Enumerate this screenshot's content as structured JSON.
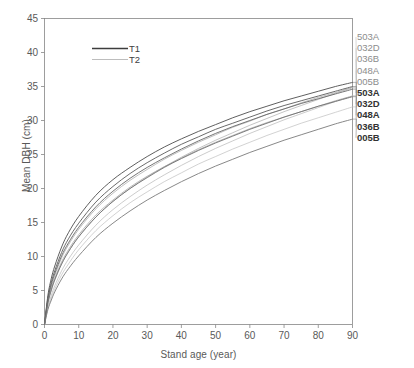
{
  "chart_data": {
    "type": "line",
    "title": "",
    "xlabel": "Stand age (year)",
    "ylabel": "Mean DBH (cm)",
    "xlim": [
      0,
      90
    ],
    "ylim": [
      0,
      45
    ],
    "xticks": [
      0,
      10,
      20,
      30,
      40,
      50,
      60,
      70,
      80,
      90
    ],
    "yticks": [
      0,
      5,
      10,
      15,
      20,
      25,
      30,
      35,
      40,
      45
    ],
    "grid": false,
    "legend": {
      "position": "top-left-inside",
      "entries": [
        {
          "label": "T1",
          "style": "solid",
          "color": "#404040"
        },
        {
          "label": "T2",
          "style": "solid-light",
          "color": "#b0b0b0"
        }
      ]
    },
    "x": [
      0,
      1,
      2,
      3,
      5,
      7,
      10,
      15,
      20,
      25,
      30,
      35,
      40,
      45,
      50,
      55,
      60,
      65,
      70,
      75,
      80,
      85,
      90
    ],
    "series": [
      {
        "name": "503A",
        "group": "T2",
        "color": "#a8a8a8",
        "end_label": "503A",
        "values": [
          0,
          3.1,
          5.0,
          6.5,
          8.9,
          10.7,
          12.9,
          15.8,
          18.1,
          20.0,
          21.7,
          23.2,
          24.6,
          25.9,
          27.1,
          28.2,
          29.3,
          30.3,
          31.3,
          32.2,
          33.1,
          34.0,
          34.8
        ]
      },
      {
        "name": "032D",
        "group": "T2",
        "color": "#a0a0a0",
        "end_label": "032D",
        "values": [
          0,
          3.5,
          5.6,
          7.2,
          9.8,
          11.7,
          14.0,
          17.0,
          19.3,
          21.2,
          22.8,
          24.3,
          25.6,
          26.8,
          27.9,
          29.0,
          29.9,
          30.9,
          31.7,
          32.6,
          33.4,
          34.1,
          34.9
        ]
      },
      {
        "name": "036B",
        "group": "T2",
        "color": "#b4b4b4",
        "end_label": "036B",
        "values": [
          0,
          2.6,
          4.3,
          5.7,
          7.9,
          9.6,
          11.7,
          14.6,
          16.9,
          18.8,
          20.5,
          22.0,
          23.4,
          24.7,
          25.9,
          27.0,
          28.1,
          29.1,
          30.1,
          31.0,
          31.9,
          32.8,
          33.6
        ]
      },
      {
        "name": "048A",
        "group": "T2",
        "color": "#9a9a9a",
        "end_label": "048A",
        "values": [
          0,
          3.3,
          5.3,
          6.8,
          9.2,
          11.0,
          13.2,
          16.1,
          18.3,
          20.2,
          21.8,
          23.2,
          24.5,
          25.7,
          26.8,
          27.8,
          28.8,
          29.7,
          30.5,
          31.3,
          32.1,
          32.9,
          33.6
        ]
      },
      {
        "name": "005B",
        "group": "T2",
        "color": "#bcbcbc",
        "end_label": "005B",
        "values": [
          0,
          2.4,
          3.9,
          5.2,
          7.3,
          8.9,
          11.0,
          13.8,
          16.0,
          17.9,
          19.5,
          21.0,
          22.3,
          23.6,
          24.7,
          25.8,
          26.8,
          27.8,
          28.7,
          29.6,
          30.4,
          31.2,
          32.0
        ]
      },
      {
        "name": "503A",
        "group": "T1",
        "color": "#4d4d4d",
        "end_label": "503A",
        "values": [
          0,
          4.3,
          6.8,
          8.6,
          11.4,
          13.5,
          15.9,
          19.0,
          21.3,
          23.1,
          24.7,
          26.1,
          27.3,
          28.4,
          29.4,
          30.4,
          31.3,
          32.1,
          32.9,
          33.6,
          34.3,
          35.0,
          35.6
        ]
      },
      {
        "name": "032D",
        "group": "T1",
        "color": "#5a5a5a",
        "end_label": "032D",
        "values": [
          0,
          3.9,
          6.2,
          7.9,
          10.6,
          12.6,
          14.9,
          18.0,
          20.3,
          22.2,
          23.8,
          25.2,
          26.5,
          27.6,
          28.7,
          29.6,
          30.5,
          31.4,
          32.2,
          32.9,
          33.6,
          34.3,
          35.0
        ]
      },
      {
        "name": "048A",
        "group": "T1",
        "color": "#666666",
        "end_label": "048A",
        "values": [
          0,
          3.7,
          5.9,
          7.5,
          10.1,
          12.0,
          14.3,
          17.3,
          19.6,
          21.5,
          23.1,
          24.5,
          25.8,
          27.0,
          28.1,
          29.1,
          30.0,
          30.9,
          31.7,
          32.5,
          33.2,
          33.9,
          34.6
        ]
      },
      {
        "name": "036B",
        "group": "T1",
        "color": "#707070",
        "end_label": "036B",
        "values": [
          0,
          3.2,
          5.1,
          6.6,
          8.9,
          10.7,
          12.9,
          15.8,
          18.1,
          20.0,
          21.6,
          23.1,
          24.4,
          25.6,
          26.7,
          27.7,
          28.7,
          29.6,
          30.5,
          31.3,
          32.1,
          32.8,
          33.5
        ]
      },
      {
        "name": "005B",
        "group": "T1",
        "color": "#7a7a7a",
        "end_label": "005B",
        "values": [
          0,
          2.2,
          3.6,
          4.8,
          6.7,
          8.2,
          10.1,
          12.8,
          14.9,
          16.7,
          18.3,
          19.7,
          21.0,
          22.2,
          23.3,
          24.3,
          25.3,
          26.2,
          27.1,
          27.9,
          28.7,
          29.5,
          30.2
        ]
      }
    ]
  },
  "axes": {
    "ylabel": "Mean DBH (cm)",
    "xlabel": "Stand age (year)",
    "yticks": [
      "45",
      "40",
      "35",
      "30",
      "25",
      "20",
      "15",
      "10",
      "5",
      "0"
    ],
    "xticks": [
      "0",
      "10",
      "20",
      "30",
      "40",
      "50",
      "60",
      "70",
      "80",
      "90"
    ]
  },
  "legend": {
    "t1": "T1",
    "t2": "T2"
  },
  "right_labels": {
    "t2": [
      "503A",
      "032D",
      "036B",
      "048A",
      "005B"
    ],
    "t1": [
      "503A",
      "032D",
      "048A",
      "036B",
      "005B"
    ]
  },
  "colors": {
    "axis": "#868686",
    "t1": "#4d4d4d",
    "t2": "#b0b0b0",
    "text": "#595959",
    "background": "#ffffff"
  }
}
